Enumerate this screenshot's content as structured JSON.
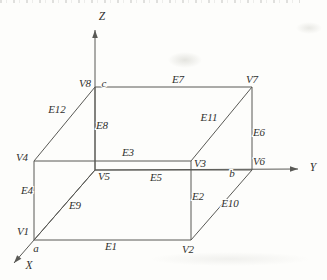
{
  "figure": {
    "type": "wireframe-cuboid-diagram",
    "background": "#fdfdfb",
    "line_color": "#595955",
    "text_color": "#30302e",
    "axes": [
      {
        "id": "x-axis",
        "label": "X",
        "from": [
          95,
          170
        ],
        "to": [
          14,
          263
        ],
        "label_pos": [
          29,
          266
        ]
      },
      {
        "id": "y-axis",
        "label": "Y",
        "from": [
          95,
          170
        ],
        "to": [
          298,
          169
        ],
        "label_pos": [
          313,
          168
        ]
      },
      {
        "id": "z-axis",
        "label": "Z",
        "from": [
          95,
          170
        ],
        "to": [
          95,
          30
        ],
        "label_pos": [
          102,
          17
        ]
      }
    ],
    "vertices": [
      {
        "id": "V1",
        "label": "V1",
        "pos": [
          34,
          240
        ],
        "label_pos": [
          23,
          232
        ]
      },
      {
        "id": "V2",
        "label": "V2",
        "pos": [
          191,
          240
        ],
        "label_pos": [
          188,
          250
        ]
      },
      {
        "id": "V3",
        "label": "V3",
        "pos": [
          191,
          161
        ],
        "label_pos": [
          200,
          164
        ]
      },
      {
        "id": "V4",
        "label": "V4",
        "pos": [
          34,
          161
        ],
        "label_pos": [
          22,
          158
        ]
      },
      {
        "id": "V5",
        "label": "V5",
        "pos": [
          95,
          170
        ],
        "label_pos": [
          104,
          177
        ]
      },
      {
        "id": "V6",
        "label": "V6",
        "pos": [
          252,
          170
        ],
        "label_pos": [
          259,
          162
        ]
      },
      {
        "id": "V7",
        "label": "V7",
        "pos": [
          252,
          87
        ],
        "label_pos": [
          252,
          80
        ]
      },
      {
        "id": "V8",
        "label": "V8",
        "pos": [
          95,
          87
        ],
        "label_pos": [
          85,
          84
        ]
      }
    ],
    "edges": [
      {
        "id": "E1",
        "label": "E1",
        "from": "V1",
        "to": "V2",
        "label_pos": [
          111,
          247
        ]
      },
      {
        "id": "E2",
        "label": "E2",
        "from": "V2",
        "to": "V3",
        "label_pos": [
          198,
          197
        ]
      },
      {
        "id": "E3",
        "label": "E3",
        "from": "V4",
        "to": "V3",
        "label_pos": [
          128,
          153
        ]
      },
      {
        "id": "E4",
        "label": "E4",
        "from": "V4",
        "to": "V1",
        "label_pos": [
          27,
          191
        ]
      },
      {
        "id": "E5",
        "label": "E5",
        "from": "V5",
        "to": "V6",
        "label_pos": [
          156,
          178
        ]
      },
      {
        "id": "E6",
        "label": "E6",
        "from": "V7",
        "to": "V6",
        "label_pos": [
          259,
          133
        ]
      },
      {
        "id": "E7",
        "label": "E7",
        "from": "V8",
        "to": "V7",
        "label_pos": [
          178,
          80
        ]
      },
      {
        "id": "E8",
        "label": "E8",
        "from": "V8",
        "to": "V5",
        "label_pos": [
          102,
          126
        ]
      },
      {
        "id": "E9",
        "label": "E9",
        "from": "V1",
        "to": "V5",
        "label_pos": [
          75,
          206
        ]
      },
      {
        "id": "E10",
        "label": "E10",
        "from": "V2",
        "to": "V6",
        "label_pos": [
          230,
          204
        ]
      },
      {
        "id": "E11",
        "label": "E11",
        "from": "V3",
        "to": "V7",
        "label_pos": [
          209,
          118
        ]
      },
      {
        "id": "E12",
        "label": "E12",
        "from": "V4",
        "to": "V8",
        "label_pos": [
          57,
          110
        ]
      }
    ],
    "intercepts": [
      {
        "id": "a",
        "label": "a",
        "pos": [
          36,
          249
        ]
      },
      {
        "id": "b",
        "label": "b",
        "pos": [
          232,
          174
        ]
      },
      {
        "id": "c",
        "label": "c",
        "pos": [
          104,
          84
        ]
      }
    ]
  }
}
